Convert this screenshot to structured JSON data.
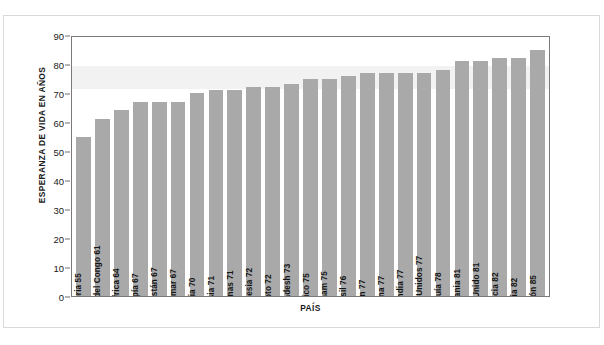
{
  "chart_data": {
    "type": "bar",
    "title": "",
    "xlabel": "PAÍS",
    "ylabel": "ESPERANZA DE VIDA EN AÑOS",
    "ylim": [
      0,
      90
    ],
    "ytick_step": 10,
    "yticks": [
      "90",
      "80",
      "70",
      "60",
      "50",
      "40",
      "30",
      "20",
      "10",
      "0"
    ],
    "grid": false,
    "legend": null,
    "bar_color": "#a9a9a9",
    "highlight_band": [
      72,
      80
    ],
    "categories": [
      "Nigeria",
      "Rep. Dem. del Congo",
      "Sudáfrica",
      "Etiopía",
      "Paquistán",
      "Myanmar",
      "India",
      "Rusia",
      "Filipinas",
      "Indonesia",
      "Egipto",
      "Bangladesh",
      "México",
      "Vietnam",
      "Brasil",
      "Irán",
      "China",
      "Tailandia",
      "Estados Unidos",
      "Turquía",
      "Alemania",
      "Reino Unido",
      "Francia",
      "Italia",
      "Japón"
    ],
    "values": [
      55,
      61,
      64,
      67,
      67,
      67,
      70,
      71,
      71,
      72,
      72,
      73,
      75,
      75,
      76,
      77,
      77,
      77,
      77,
      78,
      81,
      81,
      82,
      82,
      85
    ],
    "bar_labels": [
      "Nigeria 55",
      "Rep. Dem. del Congo 61",
      "Sudáfrica 64",
      "Etiopía 67",
      "Paquistán 67",
      "Myanmar 67",
      "India 70",
      "Rusia 71",
      "Filipinas 71",
      "Indonesia 72",
      "Egipto 72",
      "Bangladesh 73",
      "México 75",
      "Vietnam 75",
      "Brasil 76",
      "Irán 77",
      "China 77",
      "Tailandia 77",
      "Estados Unidos 77",
      "Turquía 78",
      "Alemania 81",
      "Reino Unido 81",
      "Francia 82",
      "Italia 82",
      "Japón 85"
    ]
  }
}
